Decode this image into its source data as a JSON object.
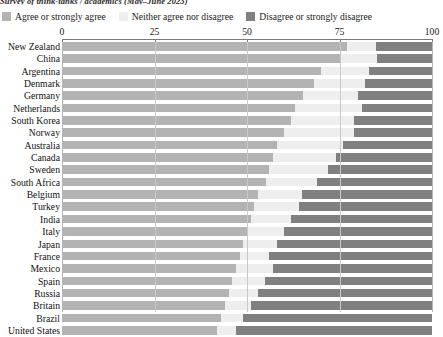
{
  "source_note": "Survey of think-tanks / academics (May–June 2023)",
  "legend": {
    "items": [
      {
        "label": "Agree or strongly agree",
        "color": "#b3b3b3",
        "key": "agree"
      },
      {
        "label": "Neither agree nor disagree",
        "color": "#eeeeee",
        "key": "neither"
      },
      {
        "label": "Disagree or strongly disagree",
        "color": "#808080",
        "key": "disagree"
      }
    ]
  },
  "axis": {
    "ticks": [
      "0",
      "25",
      "50",
      "75",
      "100"
    ],
    "min": 0,
    "max": 100
  },
  "chart_data": {
    "type": "bar",
    "orientation": "horizontal",
    "stacked": true,
    "stack_total": 100,
    "title": "",
    "xlabel": "",
    "ylabel": "",
    "xlim": [
      0,
      100
    ],
    "grid": true,
    "legend_position": "top",
    "categories": [
      "New Zealand",
      "China",
      "Argentina",
      "Denmark",
      "Germany",
      "Netherlands",
      "South Korea",
      "Norway",
      "Australia",
      "Canada",
      "Sweden",
      "South Africa",
      "Belgium",
      "Turkey",
      "India",
      "Italy",
      "Japan",
      "France",
      "Mexico",
      "Spain",
      "Russia",
      "Britain",
      "Brazil",
      "United States"
    ],
    "series": [
      {
        "name": "Agree or strongly agree",
        "color": "#b3b3b3",
        "values": [
          77,
          75,
          70,
          68,
          65,
          63,
          62,
          60,
          58,
          57,
          56,
          55,
          53,
          52,
          51,
          50,
          49,
          48,
          47,
          46,
          45,
          44,
          43,
          42
        ]
      },
      {
        "name": "Neither agree nor disagree",
        "color": "#eeeeee",
        "values": [
          8,
          10,
          13,
          14,
          15,
          18,
          17,
          19,
          18,
          17,
          16,
          14,
          12,
          12,
          11,
          10,
          9,
          8,
          10,
          9,
          8,
          7,
          6,
          5
        ]
      },
      {
        "name": "Disagree or strongly disagree",
        "color": "#808080",
        "values": [
          15,
          15,
          17,
          18,
          20,
          19,
          21,
          21,
          24,
          26,
          28,
          31,
          35,
          36,
          38,
          40,
          42,
          44,
          43,
          45,
          47,
          49,
          51,
          53
        ]
      }
    ]
  }
}
